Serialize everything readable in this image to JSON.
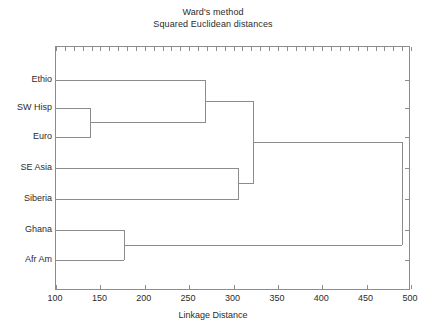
{
  "chart_data": {
    "type": "dendrogram",
    "title": "Ward's method",
    "subtitle": "Squared Euclidean distances",
    "xlabel": "Linkage Distance",
    "ylabel": "",
    "xlim": [
      100,
      500
    ],
    "xticks": [
      100,
      150,
      200,
      250,
      300,
      350,
      400,
      450,
      500
    ],
    "xtick_labels": [
      "100",
      "150",
      "200",
      "250",
      "300",
      "350",
      "400",
      "450",
      "500"
    ],
    "grid": false,
    "legend": null,
    "leaves": [
      {
        "label": "Ethio",
        "order": 0
      },
      {
        "label": "SW Hisp",
        "order": 1
      },
      {
        "label": "Euro",
        "order": 2
      },
      {
        "label": "SE Asia",
        "order": 3
      },
      {
        "label": "Siberia",
        "order": 4
      },
      {
        "label": "Ghana",
        "order": 5
      },
      {
        "label": "Afr Am",
        "order": 6
      }
    ],
    "merges": [
      {
        "id": "m1",
        "children": [
          "SW Hisp",
          "Euro"
        ],
        "distance": 139
      },
      {
        "id": "m2",
        "children": [
          "Ethio",
          "m1"
        ],
        "distance": 268
      },
      {
        "id": "m3",
        "children": [
          "SE Asia",
          "Siberia"
        ],
        "distance": 306
      },
      {
        "id": "m4",
        "children": [
          "m2",
          "m3"
        ],
        "distance": 322
      },
      {
        "id": "m5",
        "children": [
          "Ghana",
          "Afr Am"
        ],
        "distance": 177
      },
      {
        "id": "m6",
        "children": [
          "m4",
          "m5"
        ],
        "distance": 490
      }
    ],
    "colors": {
      "line": "#8c8c8c",
      "axis": "#8c8c8c",
      "text": "#2b2b2b",
      "background": "#ffffff"
    }
  }
}
